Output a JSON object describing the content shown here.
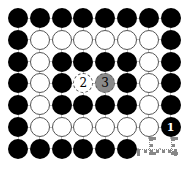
{
  "game": {
    "type": "hex-path-puzzle",
    "rows": 7,
    "cols": 8,
    "grid": [
      [
        "B",
        "B",
        "B",
        "B",
        "B",
        "B",
        "B",
        "B"
      ],
      [
        "B",
        "W",
        "W",
        "W",
        "W",
        "W",
        "W",
        "B"
      ],
      [
        "B",
        "W",
        "B",
        "B",
        "B",
        "B",
        "W",
        "B"
      ],
      [
        "B",
        "W",
        "B",
        "D2",
        "G3",
        "B",
        "W",
        "B"
      ],
      [
        "B",
        "W",
        "B",
        "B",
        "B",
        "B",
        "W",
        "B"
      ],
      [
        "B",
        "W",
        "W",
        "W",
        "W",
        "W",
        "W",
        "N1"
      ],
      [
        "B",
        "B",
        "B",
        "B",
        "B",
        "B",
        "E",
        "E"
      ]
    ],
    "labels": {
      "n1": "1",
      "d2": "2",
      "g3": "3"
    },
    "colors": {
      "black": "#000000",
      "white": "#ffffff",
      "gray": "#8a8a8a",
      "outline": "#555555",
      "path": "#888888"
    },
    "path": {
      "from": "row 6 col 8 (cell 1)",
      "to": "row 7 col 6",
      "style": "dotted"
    }
  }
}
